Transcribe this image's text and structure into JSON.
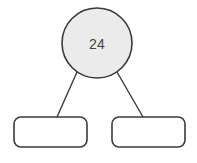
{
  "diagram": {
    "type": "number-bond",
    "background_color": "#ffffff",
    "stroke_color": "#3a3a3a",
    "text_color": "#434343",
    "whole": {
      "shape": "circle",
      "label": "24",
      "fill_color": "#ebebeb",
      "cx": 97,
      "cy": 43,
      "r": 35
    },
    "parts": [
      {
        "shape": "rounded-rectangle",
        "label": "",
        "fill_color": "#ffffff",
        "x": 14,
        "y": 117,
        "width": 73,
        "height": 30,
        "radius": 7
      },
      {
        "shape": "rounded-rectangle",
        "label": "",
        "fill_color": "#ffffff",
        "x": 112,
        "y": 117,
        "width": 73,
        "height": 30,
        "radius": 7
      }
    ],
    "edges": [
      {
        "x1": 77,
        "y1": 72,
        "x2": 57,
        "y2": 117
      },
      {
        "x1": 117,
        "y1": 72,
        "x2": 143,
        "y2": 117
      }
    ]
  }
}
